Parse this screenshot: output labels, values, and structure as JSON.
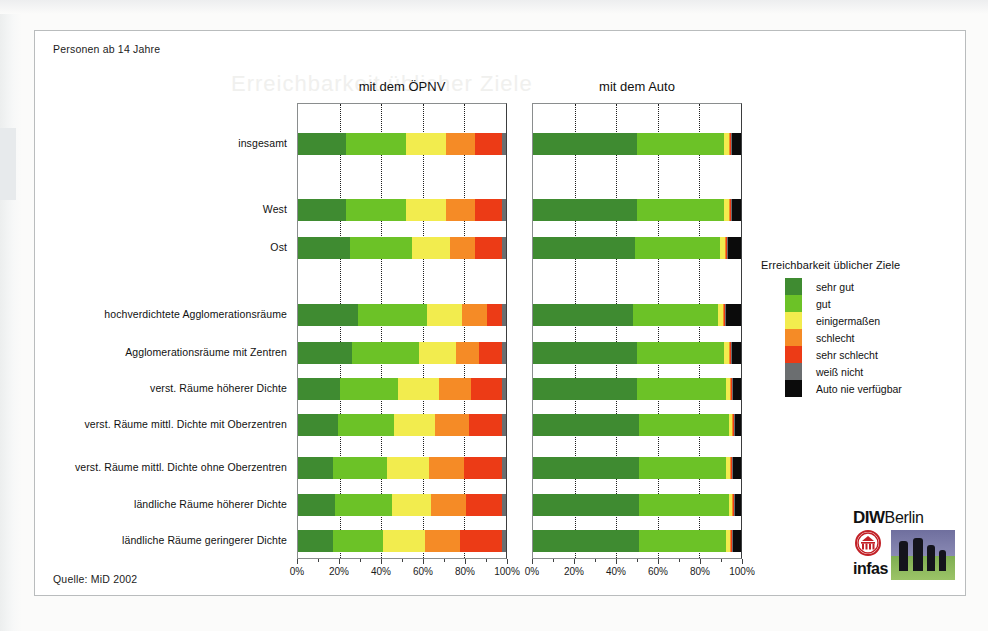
{
  "figure": {
    "caption_top": "Personen ab 14 Jahre",
    "source": "Quelle: MiD 2002",
    "ghost_text": "Erreichbarkeit üblicher Ziele"
  },
  "logo": {
    "diw": "DIW",
    "berlin": "Berlin",
    "infas": "infas",
    "seal_name": "diw-seal-icon"
  },
  "legend": {
    "title": "Erreichbarkeit üblicher Ziele",
    "items": [
      {
        "label": "sehr gut",
        "color": "#3f8b31"
      },
      {
        "label": "gut",
        "color": "#6cc227"
      },
      {
        "label": "einigermaßen",
        "color": "#f2ec4e"
      },
      {
        "label": "schlecht",
        "color": "#f58b26"
      },
      {
        "label": "sehr schlecht",
        "color": "#ec3b16"
      },
      {
        "label": "weiß nicht",
        "color": "#6b6e70"
      },
      {
        "label": "Auto nie verfügbar",
        "color": "#0b0b0b"
      }
    ]
  },
  "chart_data": {
    "type": "bar",
    "orientation": "horizontal",
    "stacked": true,
    "normalized_percent": true,
    "title": "",
    "xlabel": "",
    "ylabel": "",
    "xlim": [
      0,
      100
    ],
    "xticks": [
      0,
      20,
      40,
      60,
      80,
      100
    ],
    "xtick_labels": [
      "0%",
      "20%",
      "40%",
      "60%",
      "80%",
      "100%"
    ],
    "grid": "vertical-dotted",
    "legend_position": "right",
    "categories": [
      "insgesamt",
      "West",
      "Ost",
      "hochverdichtete Agglomerationsräume",
      "Agglomerationsräume mit  Zentren",
      "verst. Räume höherer Dichte",
      "verst. Räume mittl. Dichte mit Oberzentren",
      "verst. Räume mittl. Dichte ohne Oberzentren",
      "ländliche Räume höherer Dichte",
      "ländliche Räume geringerer Dichte"
    ],
    "series_names": [
      "sehr gut",
      "gut",
      "einigermaßen",
      "schlecht",
      "sehr schlecht",
      "weiß nicht",
      "Auto nie verfügbar"
    ],
    "panels": [
      {
        "name": "oepnv",
        "title": "mit dem ÖPNV",
        "rows": [
          {
            "category": "insgesamt",
            "values": [
              23,
              29,
              19,
              14,
              13,
              2,
              0
            ]
          },
          {
            "category": "West",
            "values": [
              23,
              29,
              19,
              14,
              13,
              2,
              0
            ]
          },
          {
            "category": "Ost",
            "values": [
              25,
              30,
              18,
              12,
              13,
              2,
              0
            ]
          },
          {
            "category": "hochverdichtete Agglomerationsräume",
            "values": [
              29,
              33,
              17,
              12,
              7,
              2,
              0
            ]
          },
          {
            "category": "Agglomerationsräume mit  Zentren",
            "values": [
              26,
              32,
              18,
              11,
              11,
              2,
              0
            ]
          },
          {
            "category": "verst. Räume höherer Dichte",
            "values": [
              20,
              28,
              20,
              15,
              15,
              2,
              0
            ]
          },
          {
            "category": "verst. Räume mittl. Dichte mit Oberzentren",
            "values": [
              19,
              27,
              20,
              16,
              16,
              2,
              0
            ]
          },
          {
            "category": "verst. Räume mittl. Dichte ohne Oberzentren",
            "values": [
              17,
              26,
              20,
              17,
              18,
              2,
              0
            ]
          },
          {
            "category": "ländliche Räume höherer Dichte",
            "values": [
              18,
              27,
              19,
              17,
              17,
              2,
              0
            ]
          },
          {
            "category": "ländliche Räume geringerer Dichte",
            "values": [
              17,
              24,
              20,
              17,
              20,
              2,
              0
            ]
          }
        ]
      },
      {
        "name": "auto",
        "title": "mit dem Auto",
        "rows": [
          {
            "category": "insgesamt",
            "values": [
              50,
              42,
              2.0,
              0.6,
              0.4,
              0.5,
              4.5
            ]
          },
          {
            "category": "West",
            "values": [
              50,
              42,
              2.0,
              0.6,
              0.4,
              0.5,
              4.5
            ]
          },
          {
            "category": "Ost",
            "values": [
              49,
              41,
              2.3,
              0.7,
              0.5,
              0.5,
              6.0
            ]
          },
          {
            "category": "hochverdichtete Agglomerationsräume",
            "values": [
              48,
              41,
              2.2,
              0.7,
              0.5,
              0.6,
              7.0
            ]
          },
          {
            "category": "Agglomerationsräume mit  Zentren",
            "values": [
              50,
              42,
              2.0,
              0.6,
              0.4,
              0.5,
              4.5
            ]
          },
          {
            "category": "verst. Räume höherer Dichte",
            "values": [
              50,
              43,
              1.8,
              0.5,
              0.4,
              0.3,
              4.0
            ]
          },
          {
            "category": "verst. Räume mittl. Dichte mit Oberzentren",
            "values": [
              51,
              43,
              1.6,
              0.5,
              0.4,
              0.5,
              3.0
            ]
          },
          {
            "category": "verst. Räume mittl. Dichte ohne Oberzentren",
            "values": [
              51,
              42,
              1.8,
              0.5,
              0.4,
              0.3,
              4.0
            ]
          },
          {
            "category": "ländliche Räume höherer Dichte",
            "values": [
              51,
              43,
              1.7,
              0.5,
              0.4,
              0.4,
              3.0
            ]
          },
          {
            "category": "ländliche Räume geringerer Dichte",
            "values": [
              51,
              42,
              1.8,
              0.5,
              0.4,
              0.3,
              4.0
            ]
          }
        ]
      }
    ]
  }
}
